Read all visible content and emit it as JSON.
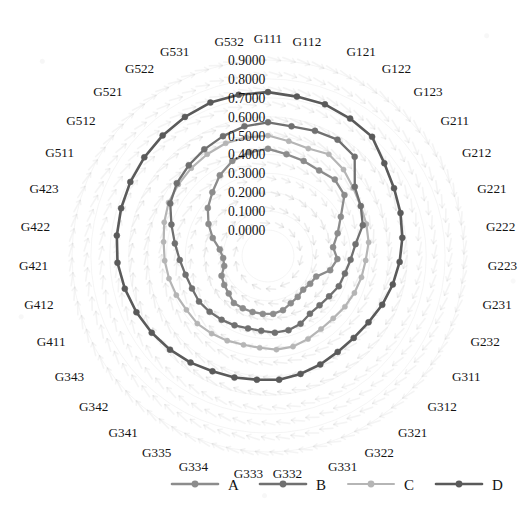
{
  "chart_data": {
    "type": "line",
    "subtype": "radar-polar",
    "title": "",
    "xlabel": "",
    "ylabel": "",
    "grid": true,
    "legend_position": "bottom",
    "rlim": [
      0.0,
      0.9
    ],
    "r_tick_labels": [
      "0.0000",
      "0.1000",
      "0.2000",
      "0.3000",
      "0.4000",
      "0.5000",
      "0.6000",
      "0.7000",
      "0.8000",
      "0.9000"
    ],
    "r_ticks": [
      0.0,
      0.1,
      0.2,
      0.3,
      0.4,
      0.5,
      0.6,
      0.7,
      0.8,
      0.9
    ],
    "categories": [
      "G111",
      "G112",
      "G121",
      "G122",
      "G123",
      "G211",
      "G212",
      "G221",
      "G222",
      "G223",
      "G231",
      "G232",
      "G311",
      "G312",
      "G321",
      "G322",
      "G331",
      "G332",
      "G333",
      "G334",
      "G335",
      "G341",
      "G342",
      "G343",
      "G411",
      "G412",
      "G421",
      "G422",
      "G423",
      "G511",
      "G512",
      "G521",
      "G522",
      "G531",
      "G532"
    ],
    "series": [
      {
        "name": "A",
        "color": "#8c8c8c",
        "values": [
          0.43,
          0.41,
          0.4,
          0.39,
          0.4,
          0.38,
          0.3,
          0.25,
          0.21,
          0.23,
          0.2,
          0.14,
          0.13,
          0.12,
          0.13,
          0.14,
          0.16,
          0.17,
          0.17,
          0.17,
          0.17,
          0.17,
          0.15,
          0.14,
          0.13,
          0.1,
          0.1,
          0.12,
          0.17,
          0.22,
          0.27,
          0.31,
          0.36,
          0.4,
          0.42
        ]
      },
      {
        "name": "B",
        "color": "#707070",
        "values": [
          0.57,
          0.56,
          0.57,
          0.58,
          0.56,
          0.45,
          0.42,
          0.39,
          0.33,
          0.3,
          0.28,
          0.27,
          0.25,
          0.24,
          0.24,
          0.26,
          0.27,
          0.27,
          0.26,
          0.26,
          0.27,
          0.28,
          0.29,
          0.3,
          0.3,
          0.31,
          0.33,
          0.36,
          0.4,
          0.45,
          0.48,
          0.5,
          0.52,
          0.54,
          0.56
        ]
      },
      {
        "name": "C",
        "color": "#b5b5b5",
        "values": [
          0.5,
          0.48,
          0.47,
          0.49,
          0.47,
          0.44,
          0.42,
          0.41,
          0.4,
          0.38,
          0.37,
          0.36,
          0.35,
          0.34,
          0.34,
          0.35,
          0.36,
          0.36,
          0.35,
          0.35,
          0.36,
          0.37,
          0.38,
          0.38,
          0.39,
          0.4,
          0.41,
          0.42,
          0.44,
          0.46,
          0.47,
          0.48,
          0.49,
          0.5,
          0.5
        ]
      },
      {
        "name": "D",
        "color": "#5a5a5a",
        "values": [
          0.73,
          0.72,
          0.72,
          0.71,
          0.7,
          0.65,
          0.62,
          0.6,
          0.58,
          0.56,
          0.54,
          0.52,
          0.5,
          0.49,
          0.49,
          0.5,
          0.51,
          0.52,
          0.52,
          0.53,
          0.54,
          0.56,
          0.58,
          0.6,
          0.62,
          0.64,
          0.66,
          0.67,
          0.68,
          0.69,
          0.7,
          0.71,
          0.72,
          0.73,
          0.73
        ]
      }
    ]
  },
  "axis": {
    "tick_labels": [
      "0.9000",
      "0.8000",
      "0.7000",
      "0.6000",
      "0.5000",
      "0.4000",
      "0.3000",
      "0.2000",
      "0.1000",
      "0.0000"
    ]
  },
  "category_labels": [
    "G111",
    "G112",
    "G121",
    "G122",
    "G123",
    "G211",
    "G212",
    "G221",
    "G222",
    "G223",
    "G231",
    "G232",
    "G311",
    "G312",
    "G321",
    "G322",
    "G331",
    "G332",
    "G333",
    "G334",
    "G335",
    "G341",
    "G342",
    "G343",
    "G411",
    "G412",
    "G421",
    "G422",
    "G423",
    "G511",
    "G512",
    "G521",
    "G522",
    "G531",
    "G532"
  ],
  "legend": {
    "entries": [
      {
        "label": "A",
        "color": "#8c8c8c"
      },
      {
        "label": "B",
        "color": "#707070"
      },
      {
        "label": "C",
        "color": "#b5b5b5"
      },
      {
        "label": "D",
        "color": "#5a5a5a"
      }
    ]
  },
  "style": {
    "background_pattern": "arrow-swirl",
    "background_color": "#ffffff",
    "grid_color": "#d9d9d9"
  }
}
